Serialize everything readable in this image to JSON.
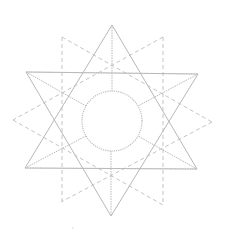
{
  "diagram": {
    "title": "",
    "colors": {
      "background": "#ffffff",
      "solid_stroke": "#b8b8b8",
      "dashed_stroke": "#c4c4c4",
      "dotted_stroke": "#bdbdbd"
    },
    "solid_triangles": [
      {
        "name": "upward-triangle",
        "points": [
          [
            112,
            25
          ],
          [
            25,
            168
          ],
          [
            197,
            169
          ]
        ]
      },
      {
        "name": "downward-triangle",
        "points": [
          [
            26,
            72
          ],
          [
            198,
            74
          ],
          [
            111,
            216
          ]
        ]
      }
    ],
    "dashed_star": {
      "name": "dashed-rotated-star",
      "outer_points": [
        [
          62,
          37
        ],
        [
          163,
          37
        ],
        [
          212,
          122
        ],
        [
          163,
          205
        ],
        [
          61,
          202
        ],
        [
          13,
          120
        ]
      ],
      "segments": [
        [
          [
            62,
            37
          ],
          [
            62,
            202
          ]
        ],
        [
          [
            163,
            37
          ],
          [
            163,
            205
          ]
        ],
        [
          [
            62,
            37
          ],
          [
            212,
            122
          ]
        ],
        [
          [
            163,
            37
          ],
          [
            13,
            120
          ]
        ],
        [
          [
            13,
            120
          ],
          [
            163,
            205
          ]
        ],
        [
          [
            212,
            122
          ],
          [
            61,
            202
          ]
        ]
      ]
    },
    "circle": {
      "cx": 112,
      "cy": 121,
      "r": 30
    },
    "spokes": [
      [
        [
          112,
          25
        ],
        [
          112,
          91
        ]
      ],
      [
        [
          111,
          151
        ],
        [
          111,
          216
        ]
      ],
      [
        [
          26,
          72
        ],
        [
          86,
          106
        ]
      ],
      [
        [
          198,
          74
        ],
        [
          138,
          106
        ]
      ],
      [
        [
          25,
          168
        ],
        [
          86,
          136
        ]
      ],
      [
        [
          197,
          169
        ],
        [
          138,
          136
        ]
      ]
    ],
    "top_horizontal": [
      [
        26,
        72
      ],
      [
        198,
        74
      ]
    ],
    "bottom_horizontal": [
      [
        25,
        168
      ],
      [
        197,
        169
      ]
    ],
    "stray_dot": {
      "cx": 73,
      "cy": 228
    }
  }
}
